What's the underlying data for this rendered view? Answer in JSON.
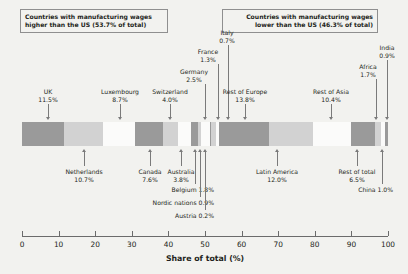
{
  "header": {
    "left_box": "Countries with manufacturing wages\nhigher than the US (53.7% of total)",
    "right_box": "Countries with manufacturing wages\nlower than the US (46.3% of total)"
  },
  "axis": {
    "title": "Share of total (%)",
    "ticks": [
      "0",
      "10",
      "20",
      "30",
      "40",
      "50",
      "60",
      "70",
      "80",
      "90",
      "100"
    ],
    "min": 0,
    "max": 100
  },
  "colors": {
    "background": "#f2f2ef",
    "dark_gray": "#9a9a9a",
    "light_gray": "#d2d2d2",
    "white": "#fbfbfa",
    "axis": "#6b6b6b",
    "leader": "#7a7a7a",
    "text": "#231f20"
  },
  "chart_data": {
    "type": "bar",
    "orientation": "horizontal-stacked",
    "title": "",
    "xlabel": "Share of total (%)",
    "ylabel": "",
    "xlim": [
      0,
      100
    ],
    "grid": false,
    "legend": "none",
    "categories": [
      "UK",
      "Netherlands",
      "Luxembourg",
      "Canada",
      "Switzerland",
      "Australia",
      "Belgium",
      "Nordic nations",
      "Germany",
      "Austria",
      "France",
      "Italy",
      "Rest of Europe",
      "Latin America",
      "Rest of Asia",
      "Rest of total",
      "Africa",
      "China",
      "India"
    ],
    "values": [
      11.5,
      10.7,
      8.7,
      7.6,
      4.0,
      3.8,
      1.8,
      0.9,
      2.5,
      0.2,
      1.3,
      0.7,
      13.8,
      12.0,
      10.4,
      6.5,
      1.7,
      1.0,
      0.9
    ],
    "annotations": [
      {
        "name": "UK",
        "label": "UK",
        "value": "11.5%",
        "side": "above"
      },
      {
        "name": "Netherlands",
        "label": "Netherlands",
        "value": "10.7%",
        "side": "below"
      },
      {
        "name": "Luxembourg",
        "label": "Luxembourg",
        "value": "8.7%",
        "side": "above"
      },
      {
        "name": "Canada",
        "label": "Canada",
        "value": "7.6%",
        "side": "below"
      },
      {
        "name": "Switzerland",
        "label": "Switzerland",
        "value": "4.0%",
        "side": "above"
      },
      {
        "name": "Australia",
        "label": "Australia",
        "value": "3.8%",
        "side": "below"
      },
      {
        "name": "Belgium",
        "label": "Belgium 1.8%",
        "value": "",
        "side": "below"
      },
      {
        "name": "Nordic nations",
        "label": "Nordic nations 0.9%",
        "value": "",
        "side": "below"
      },
      {
        "name": "Germany",
        "label": "Germany",
        "value": "2.5%",
        "side": "above"
      },
      {
        "name": "Austria",
        "label": "Austria 0.2%",
        "value": "",
        "side": "below"
      },
      {
        "name": "France",
        "label": "France",
        "value": "1.3%",
        "side": "above"
      },
      {
        "name": "Italy",
        "label": "Italy",
        "value": "0.7%",
        "side": "above"
      },
      {
        "name": "Rest of Europe",
        "label": "Rest of Europe",
        "value": "13.8%",
        "side": "above"
      },
      {
        "name": "Latin America",
        "label": "Latin America",
        "value": "12.0%",
        "side": "below"
      },
      {
        "name": "Rest of Asia",
        "label": "Rest of Asia",
        "value": "10.4%",
        "side": "above"
      },
      {
        "name": "Rest of total",
        "label": "Rest of total",
        "value": "6.5%",
        "side": "below"
      },
      {
        "name": "Africa",
        "label": "Africa",
        "value": "1.7%",
        "side": "above"
      },
      {
        "name": "China",
        "label": "China 1.0%",
        "value": "",
        "side": "below"
      },
      {
        "name": "India",
        "label": "India",
        "value": "0.9%",
        "side": "above"
      }
    ]
  },
  "segments": [
    {
      "name": "UK",
      "start": 0.0,
      "width": 11.5,
      "shade": "dark"
    },
    {
      "name": "Netherlands",
      "start": 11.5,
      "width": 10.7,
      "shade": "light"
    },
    {
      "name": "Luxembourg",
      "start": 22.2,
      "width": 8.7,
      "shade": "white"
    },
    {
      "name": "Canada",
      "start": 30.9,
      "width": 7.6,
      "shade": "dark"
    },
    {
      "name": "Switzerland",
      "start": 38.5,
      "width": 4.0,
      "shade": "light"
    },
    {
      "name": "Australia",
      "start": 42.5,
      "width": 3.8,
      "shade": "white"
    },
    {
      "name": "Belgium",
      "start": 46.3,
      "width": 1.8,
      "shade": "dark"
    },
    {
      "name": "Nordic nations",
      "start": 48.1,
      "width": 0.9,
      "shade": "light"
    },
    {
      "name": "Germany",
      "start": 49.0,
      "width": 2.5,
      "shade": "white"
    },
    {
      "name": "Austria",
      "start": 51.5,
      "width": 0.2,
      "shade": "dark"
    },
    {
      "name": "France",
      "start": 51.7,
      "width": 1.3,
      "shade": "light"
    },
    {
      "name": "Italy",
      "start": 53.0,
      "width": 0.7,
      "shade": "white"
    },
    {
      "name": "Rest of Europe",
      "start": 53.7,
      "width": 13.8,
      "shade": "dark"
    },
    {
      "name": "Latin America",
      "start": 67.5,
      "width": 12.0,
      "shade": "light"
    },
    {
      "name": "Rest of Asia",
      "start": 79.5,
      "width": 10.4,
      "shade": "white"
    },
    {
      "name": "Rest of total",
      "start": 89.9,
      "width": 6.5,
      "shade": "dark"
    },
    {
      "name": "Africa",
      "start": 96.4,
      "width": 1.7,
      "shade": "light"
    },
    {
      "name": "China",
      "start": 98.1,
      "width": 1.0,
      "shade": "white"
    },
    {
      "name": "India",
      "start": 99.1,
      "width": 0.9,
      "shade": "dark"
    }
  ],
  "label_layout": [
    {
      "key": "UK",
      "tx": 48,
      "ty": 88,
      "align": "c",
      "lx": 48,
      "ly0": 104,
      "ly1": 118
    },
    {
      "key": "Luxembourg",
      "tx": 120,
      "ty": 88,
      "align": "c",
      "lx": 120,
      "ly0": 104,
      "ly1": 118
    },
    {
      "key": "Switzerland",
      "tx": 170,
      "ty": 88,
      "align": "c",
      "lx": 170,
      "ly0": 104,
      "ly1": 118
    },
    {
      "key": "Germany",
      "tx": 194,
      "ty": 68,
      "align": "c",
      "lx": 205,
      "ly0": 84,
      "ly1": 118
    },
    {
      "key": "France",
      "tx": 208,
      "ty": 48,
      "align": "c",
      "lx": 218,
      "ly0": 64,
      "ly1": 118
    },
    {
      "key": "Italy",
      "tx": 227,
      "ty": 29,
      "align": "c",
      "lx": 228,
      "ly0": 45,
      "ly1": 118
    },
    {
      "key": "Rest of Europe",
      "tx": 245,
      "ty": 88,
      "align": "c",
      "lx": 245,
      "ly0": 104,
      "ly1": 118
    },
    {
      "key": "Rest of Asia",
      "tx": 331,
      "ty": 88,
      "align": "c",
      "lx": 331,
      "ly0": 104,
      "ly1": 118
    },
    {
      "key": "Africa",
      "tx": 368,
      "ty": 63,
      "align": "c",
      "lx": 376,
      "ly0": 79,
      "ly1": 118
    },
    {
      "key": "India",
      "tx": 387,
      "ty": 44,
      "align": "c",
      "lx": 387,
      "ly0": 60,
      "ly1": 118
    },
    {
      "key": "Netherlands",
      "tx": 84,
      "ty": 168,
      "align": "c",
      "lx": 84,
      "ly0": 152,
      "ly1": 166
    },
    {
      "key": "Canada",
      "tx": 150,
      "ty": 168,
      "align": "c",
      "lx": 150,
      "ly0": 152,
      "ly1": 166
    },
    {
      "key": "Australia",
      "tx": 181,
      "ty": 168,
      "align": "c",
      "lx": 181,
      "ly0": 152,
      "ly1": 166
    },
    {
      "key": "Belgium",
      "tx": 214,
      "ty": 186,
      "align": "r",
      "lx": 195,
      "ly0": 152,
      "ly1": 184
    },
    {
      "key": "Nordic nations",
      "tx": 214,
      "ty": 199,
      "align": "r",
      "lx": 200,
      "ly0": 152,
      "ly1": 197
    },
    {
      "key": "Austria",
      "tx": 214,
      "ty": 212,
      "align": "r",
      "lx": 205,
      "ly0": 152,
      "ly1": 210
    },
    {
      "key": "Latin America",
      "tx": 277,
      "ty": 168,
      "align": "c",
      "lx": 277,
      "ly0": 152,
      "ly1": 166
    },
    {
      "key": "Rest of total",
      "tx": 357,
      "ty": 168,
      "align": "c",
      "lx": 357,
      "ly0": 152,
      "ly1": 166
    },
    {
      "key": "China",
      "tx": 393,
      "ty": 186,
      "align": "r",
      "lx": 382,
      "ly0": 152,
      "ly1": 184
    }
  ]
}
